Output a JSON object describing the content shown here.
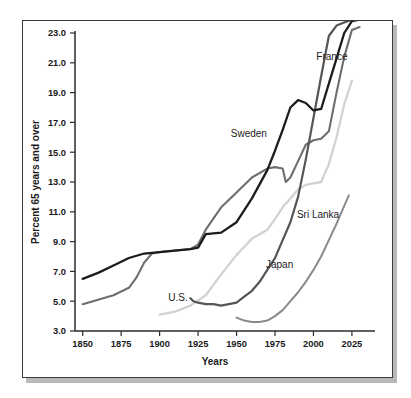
{
  "figure": {
    "background_color": "#ffffff",
    "frame_color": "#3a3a3a",
    "shadow_color": "#b9b9b9"
  },
  "chart_data": {
    "type": "line",
    "title": "",
    "xlabel": "Years",
    "ylabel": "Percent 65 years and over",
    "xlim": [
      1845,
      2040
    ],
    "ylim": [
      3.0,
      23.0
    ],
    "grid": false,
    "legend": "inline-labels",
    "xticks": [
      1850,
      1875,
      1900,
      1925,
      1950,
      1975,
      2000,
      2025
    ],
    "xtick_labels": [
      "1850",
      "1875",
      "1900",
      "1925",
      "1950",
      "1975",
      "2000",
      "2025"
    ],
    "yticks": [
      3.0,
      5.0,
      7.0,
      9.0,
      11.0,
      13.0,
      15.0,
      17.0,
      19.0,
      21.0,
      23.0
    ],
    "ytick_labels": [
      "3.0",
      "5.0",
      "7.0",
      "9.0",
      "11.0",
      "13.0",
      "15.0",
      "17.0",
      "19.0",
      "21.0",
      "23.0"
    ],
    "series": [
      {
        "name": "Sweden",
        "color": "#1c1c1c",
        "width": 2.3,
        "label_x": 1958,
        "label_y": 16.0,
        "x": [
          1850,
          1860,
          1870,
          1880,
          1890,
          1900,
          1910,
          1920,
          1925,
          1930,
          1940,
          1950,
          1960,
          1970,
          1975,
          1980,
          1985,
          1990,
          1995,
          2000,
          2005,
          2010,
          2015,
          2020,
          2025,
          2030
        ],
        "y": [
          6.5,
          6.9,
          7.4,
          7.9,
          8.2,
          8.3,
          8.4,
          8.5,
          8.6,
          9.5,
          9.6,
          10.3,
          11.9,
          13.8,
          15.1,
          16.5,
          18.0,
          18.5,
          18.3,
          17.8,
          17.9,
          19.6,
          21.3,
          23.0,
          23.8,
          23.9
        ]
      },
      {
        "name": "France",
        "color": "#6e6e6e",
        "width": 2.1,
        "label_x": 2012,
        "label_y": 21.2,
        "x": [
          1850,
          1860,
          1870,
          1880,
          1885,
          1890,
          1895,
          1900,
          1910,
          1920,
          1925,
          1930,
          1940,
          1950,
          1960,
          1970,
          1975,
          1980,
          1982,
          1985,
          1990,
          1995,
          2000,
          2005,
          2010,
          2015,
          2020,
          2025,
          2030
        ],
        "y": [
          4.8,
          5.1,
          5.4,
          5.9,
          6.6,
          7.6,
          8.2,
          8.3,
          8.4,
          8.5,
          8.8,
          9.8,
          11.3,
          12.3,
          13.3,
          13.9,
          14.0,
          13.9,
          13.0,
          13.3,
          14.4,
          15.5,
          15.8,
          15.9,
          16.4,
          19.0,
          21.4,
          23.2,
          23.4
        ]
      },
      {
        "name": "U.S.",
        "color": "#d2d2d2",
        "width": 2.3,
        "label_x": 1912,
        "label_y": 5.0,
        "x": [
          1900,
          1910,
          1920,
          1930,
          1940,
          1950,
          1960,
          1965,
          1970,
          1975,
          1980,
          1985,
          1990,
          1995,
          2000,
          2005,
          2010,
          2015,
          2020,
          2025
        ],
        "y": [
          4.1,
          4.3,
          4.7,
          5.4,
          6.8,
          8.1,
          9.2,
          9.5,
          9.8,
          10.5,
          11.3,
          11.9,
          12.5,
          12.8,
          12.9,
          13.0,
          14.2,
          16.0,
          18.2,
          19.8
        ]
      },
      {
        "name": "Japan",
        "color": "#555555",
        "width": 2.2,
        "label_x": 1978,
        "label_y": 7.2,
        "x": [
          1920,
          1922,
          1925,
          1930,
          1935,
          1940,
          1945,
          1950,
          1955,
          1960,
          1965,
          1970,
          1975,
          1980,
          1985,
          1990,
          1995,
          2000,
          2005,
          2010,
          2015,
          2020,
          2025
        ],
        "y": [
          5.2,
          5.0,
          4.9,
          4.8,
          4.8,
          4.7,
          4.8,
          4.9,
          5.3,
          5.7,
          6.3,
          7.1,
          7.9,
          9.1,
          10.3,
          12.0,
          14.5,
          17.3,
          20.1,
          22.8,
          23.5,
          23.7,
          23.9
        ]
      },
      {
        "name": "Sri Lanka",
        "color": "#8a8a8a",
        "width": 2.0,
        "label_x": 2003,
        "label_y": 10.6,
        "x": [
          1950,
          1955,
          1960,
          1965,
          1970,
          1975,
          1980,
          1985,
          1990,
          1995,
          2000,
          2005,
          2010,
          2015,
          2020,
          2023
        ],
        "y": [
          3.9,
          3.7,
          3.6,
          3.6,
          3.7,
          4.0,
          4.4,
          5.0,
          5.6,
          6.3,
          7.1,
          8.0,
          9.1,
          10.2,
          11.4,
          12.1
        ]
      }
    ]
  }
}
